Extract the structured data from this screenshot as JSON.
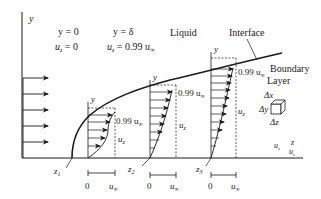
{
  "colors": {
    "stroke": "#1a1a1a",
    "background": "#ffffff"
  },
  "labels": {
    "y_axis": "y",
    "wall_condition": {
      "y": "y = 0",
      "u": "u",
      "u_sub": "z",
      "u_val": " = 0"
    },
    "edge_condition": {
      "y": "y = δ",
      "u": "u",
      "u_sub": "z",
      "u_val": " = 0.99 u",
      "u_val_sub": "∞"
    },
    "liquid": "Liquid",
    "interface": "Interface",
    "boundary": "Boundary",
    "layer": "Layer",
    "element": {
      "dx": "Δx",
      "dy": "Δy",
      "dz": "Δz"
    },
    "z_axis": "z",
    "uz_corner": {
      "u": "u",
      "sub": "z"
    },
    "uz_corner2": {
      "u": "u",
      "sub": "z"
    }
  },
  "profiles": [
    {
      "id": "z1",
      "station": "z",
      "station_sub": "1",
      "y_label": "y",
      "edge_label": "0.99 u",
      "edge_sub": "∞",
      "uz_label": "u",
      "uz_sub": "z",
      "scale_zero": "0",
      "scale_end": "u",
      "scale_end_sub": "∞"
    },
    {
      "id": "z2",
      "station": "z",
      "station_sub": "2",
      "y_label": "y",
      "edge_label": "0.99 u",
      "edge_sub": "∞",
      "uz_label": "u",
      "uz_sub": "z",
      "scale_zero": "0",
      "scale_end": "u",
      "scale_end_sub": "∞"
    },
    {
      "id": "z3",
      "station": "z",
      "station_sub": "3",
      "y_label": "y",
      "edge_label": "0.99 u",
      "edge_sub": "∞",
      "uz_label": "u",
      "uz_sub": "z",
      "scale_zero": "0",
      "scale_end": "u",
      "scale_end_sub": "∞"
    }
  ]
}
